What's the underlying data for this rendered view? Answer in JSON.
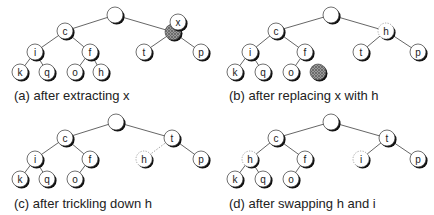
{
  "figure": {
    "node_radius": 8,
    "colors": {
      "edge": "#555555",
      "edge_dashed": "#999999",
      "node_fill": "#ffffff",
      "node_stroke": "#333333",
      "node_shadow": "#111111",
      "shaded_fill": "#777777",
      "label": "#222222"
    },
    "panels": [
      {
        "id": "a",
        "caption": "(a) after extracting x",
        "caption_pos": [
          14,
          88
        ],
        "nodes": [
          {
            "id": "root",
            "label": "",
            "x": 115,
            "y": 15
          },
          {
            "id": "c",
            "label": "c",
            "x": 65,
            "y": 31
          },
          {
            "id": "slot",
            "label": "",
            "x": 173,
            "y": 32,
            "style": "shaded"
          },
          {
            "id": "x",
            "label": "x",
            "x": 178,
            "y": 22,
            "style": "floating"
          },
          {
            "id": "i",
            "label": "i",
            "x": 35,
            "y": 52
          },
          {
            "id": "f",
            "label": "f",
            "x": 90,
            "y": 52
          },
          {
            "id": "t",
            "label": "t",
            "x": 144,
            "y": 52
          },
          {
            "id": "p",
            "label": "p",
            "x": 201,
            "y": 52
          },
          {
            "id": "k",
            "label": "k",
            "x": 20,
            "y": 72
          },
          {
            "id": "q",
            "label": "q",
            "x": 47,
            "y": 72
          },
          {
            "id": "o",
            "label": "o",
            "x": 75,
            "y": 72
          },
          {
            "id": "h",
            "label": "h",
            "x": 101,
            "y": 72
          }
        ],
        "edges": [
          [
            "root",
            "c"
          ],
          [
            "root",
            "slot"
          ],
          [
            "c",
            "i"
          ],
          [
            "c",
            "f"
          ],
          [
            "slot",
            "t"
          ],
          [
            "slot",
            "p"
          ],
          [
            "i",
            "k"
          ],
          [
            "i",
            "q"
          ],
          [
            "f",
            "o"
          ],
          [
            "f",
            "h"
          ]
        ]
      },
      {
        "id": "b",
        "caption": "(b) after replacing x with h",
        "caption_pos": [
          229,
          88
        ],
        "nodes": [
          {
            "id": "root",
            "label": "",
            "x": 331,
            "y": 15
          },
          {
            "id": "c",
            "label": "c",
            "x": 276,
            "y": 31
          },
          {
            "id": "h",
            "label": "h",
            "x": 386,
            "y": 31,
            "style": "dashed"
          },
          {
            "id": "i",
            "label": "i",
            "x": 250,
            "y": 52
          },
          {
            "id": "f",
            "label": "f",
            "x": 305,
            "y": 52
          },
          {
            "id": "t",
            "label": "t",
            "x": 361,
            "y": 52
          },
          {
            "id": "p",
            "label": "p",
            "x": 418,
            "y": 52
          },
          {
            "id": "k",
            "label": "k",
            "x": 235,
            "y": 72
          },
          {
            "id": "q",
            "label": "q",
            "x": 263,
            "y": 72
          },
          {
            "id": "o",
            "label": "o",
            "x": 291,
            "y": 72
          },
          {
            "id": "slot",
            "label": "",
            "x": 318,
            "y": 72,
            "style": "shaded"
          }
        ],
        "edges": [
          [
            "root",
            "c"
          ],
          [
            "root",
            "h"
          ],
          [
            "c",
            "i"
          ],
          [
            "c",
            "f"
          ],
          [
            "h",
            "t"
          ],
          [
            "h",
            "p"
          ],
          [
            "i",
            "k"
          ],
          [
            "i",
            "q"
          ],
          [
            "f",
            "o"
          ]
        ]
      },
      {
        "id": "c",
        "caption": "(c) after trickling down h",
        "caption_pos": [
          14,
          196
        ],
        "nodes": [
          {
            "id": "root",
            "label": "",
            "x": 116,
            "y": 122
          },
          {
            "id": "c",
            "label": "c",
            "x": 65,
            "y": 138
          },
          {
            "id": "t",
            "label": "t",
            "x": 172,
            "y": 138
          },
          {
            "id": "i",
            "label": "i",
            "x": 35,
            "y": 159
          },
          {
            "id": "f",
            "label": "f",
            "x": 90,
            "y": 159
          },
          {
            "id": "h",
            "label": "h",
            "x": 144,
            "y": 159,
            "style": "dashed"
          },
          {
            "id": "p",
            "label": "p",
            "x": 201,
            "y": 159
          },
          {
            "id": "k",
            "label": "k",
            "x": 20,
            "y": 179
          },
          {
            "id": "q",
            "label": "q",
            "x": 47,
            "y": 179
          },
          {
            "id": "o",
            "label": "o",
            "x": 75,
            "y": 179
          }
        ],
        "edges": [
          [
            "root",
            "c"
          ],
          [
            "root",
            "t"
          ],
          [
            "c",
            "i"
          ],
          [
            "c",
            "f"
          ],
          [
            "t",
            "h",
            "dashed"
          ],
          [
            "t",
            "p"
          ],
          [
            "i",
            "k"
          ],
          [
            "i",
            "q"
          ],
          [
            "f",
            "o"
          ]
        ]
      },
      {
        "id": "d",
        "caption": "(d) after swapping h and i",
        "caption_pos": [
          229,
          196
        ],
        "nodes": [
          {
            "id": "root",
            "label": "",
            "x": 331,
            "y": 122
          },
          {
            "id": "c",
            "label": "c",
            "x": 276,
            "y": 138
          },
          {
            "id": "t",
            "label": "t",
            "x": 387,
            "y": 138
          },
          {
            "id": "h",
            "label": "h",
            "x": 250,
            "y": 159,
            "style": "dashed"
          },
          {
            "id": "f",
            "label": "f",
            "x": 305,
            "y": 159
          },
          {
            "id": "i",
            "label": "i",
            "x": 361,
            "y": 159,
            "style": "dashed"
          },
          {
            "id": "p",
            "label": "p",
            "x": 418,
            "y": 159
          },
          {
            "id": "k",
            "label": "k",
            "x": 235,
            "y": 179
          },
          {
            "id": "q",
            "label": "q",
            "x": 263,
            "y": 179
          },
          {
            "id": "o",
            "label": "o",
            "x": 291,
            "y": 179
          }
        ],
        "edges": [
          [
            "root",
            "c"
          ],
          [
            "root",
            "t"
          ],
          [
            "c",
            "h"
          ],
          [
            "c",
            "f"
          ],
          [
            "t",
            "i"
          ],
          [
            "t",
            "p"
          ],
          [
            "h",
            "k"
          ],
          [
            "h",
            "q"
          ],
          [
            "f",
            "o"
          ]
        ]
      }
    ]
  }
}
